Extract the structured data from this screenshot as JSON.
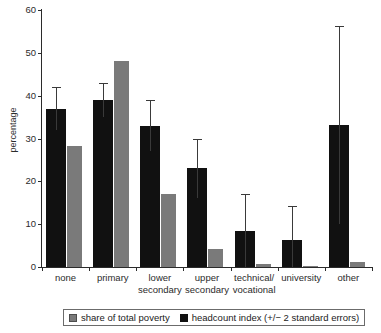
{
  "chart_data": {
    "type": "bar",
    "title": "",
    "xlabel": "",
    "ylabel": "percentage",
    "ylim": [
      0,
      60
    ],
    "yticks": [
      0,
      10,
      20,
      30,
      40,
      50,
      60
    ],
    "ytick_labels": [
      "0",
      "10",
      "20",
      "30",
      "40",
      "50",
      "60"
    ],
    "grid": false,
    "legend_position": "bottom",
    "categories": [
      "none",
      "primary",
      "lower\nsecondary",
      "upper\nsecondary",
      "technical/\nvocational",
      "university",
      "other"
    ],
    "series": [
      {
        "name": "headcount index (+/− 2 standard errors)",
        "color": "#111111",
        "values": [
          37.0,
          39.0,
          33.0,
          23.0,
          8.3,
          6.3,
          33.2
        ],
        "error_upper": [
          42.0,
          43.0,
          39.0,
          30.0,
          17.0,
          14.2,
          56.3
        ],
        "error_lower": [
          32.0,
          35.0,
          27.0,
          16.0,
          0.0,
          0.0,
          10.0
        ]
      },
      {
        "name": "share of total poverty",
        "color": "#7a7a7a",
        "values": [
          28.2,
          48.0,
          17.0,
          4.1,
          0.7,
          0.2,
          1.2
        ],
        "error_upper": null,
        "error_lower": null
      }
    ]
  },
  "legend": {
    "entries": [
      {
        "label": "share of total poverty",
        "swatch": "gray"
      },
      {
        "label": "headcount index (+/− 2 standard errors)",
        "swatch": "black"
      }
    ]
  },
  "axis": {
    "y_title": "percentage"
  }
}
